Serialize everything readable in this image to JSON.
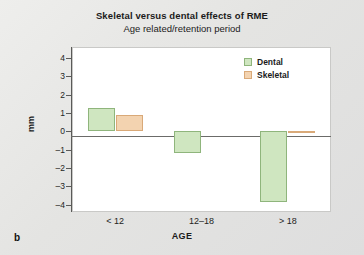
{
  "figure": {
    "panel_label": "b"
  },
  "chart_data": {
    "type": "bar",
    "title": "Skeletal versus dental effects of RME",
    "subtitle": "Age related/retention period",
    "xlabel": "AGE",
    "ylabel": "mm",
    "categories": [
      "< 12",
      "12–18",
      "> 18"
    ],
    "series": [
      {
        "name": "Dental",
        "color": "#cfe6c0",
        "border": "#8fb57c",
        "values": [
          1.3,
          -1.2,
          -3.85
        ]
      },
      {
        "name": "Skeletal",
        "color": "#f3d3b0",
        "border": "#d9a978",
        "values": [
          0.9,
          0,
          -0.1
        ]
      }
    ],
    "ylim": [
      -4.4,
      4.6
    ],
    "yticks": [
      4,
      3,
      2,
      1,
      0,
      -1,
      -2,
      -3,
      -4
    ],
    "ytick_labels": [
      "4",
      "3",
      "2",
      "1",
      "0",
      "–1",
      "–2",
      "–3",
      "–4"
    ],
    "grid": false,
    "legend_position": "top-right"
  }
}
